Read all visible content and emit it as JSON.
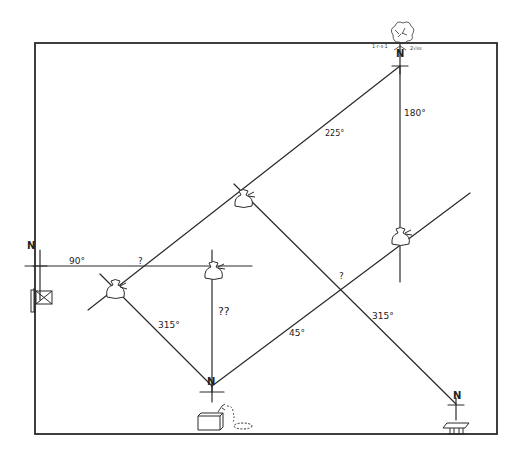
{
  "diagram": {
    "type": "treasure-map-bearings",
    "stroke_color": "#2a2a2a",
    "labels": {
      "bearing_90": "90°",
      "bearing_225": "225°",
      "bearing_180": "180°",
      "bearing_315_left": "315°",
      "bearing_45": "45°",
      "bearing_315_right": "315°",
      "unknown_top_left": "?",
      "unknown_middle": "??",
      "unknown_right": "?",
      "north_left": "N",
      "north_top": "N",
      "north_bottom": "N",
      "north_right": "N"
    },
    "landmarks": [
      {
        "id": "flag",
        "icon": "flag-icon",
        "position": "left"
      },
      {
        "id": "tree",
        "icon": "tree-icon",
        "position": "top-right"
      },
      {
        "id": "chest",
        "icon": "treasure-chest-icon",
        "position": "bottom-center"
      },
      {
        "id": "bench",
        "icon": "bench-icon",
        "position": "bottom-right"
      }
    ],
    "money_bags": [
      {
        "id": "bag-1",
        "position": "left-intersection"
      },
      {
        "id": "bag-2",
        "position": "center-top"
      },
      {
        "id": "bag-3",
        "position": "center-left"
      },
      {
        "id": "bag-4",
        "position": "right"
      }
    ]
  }
}
